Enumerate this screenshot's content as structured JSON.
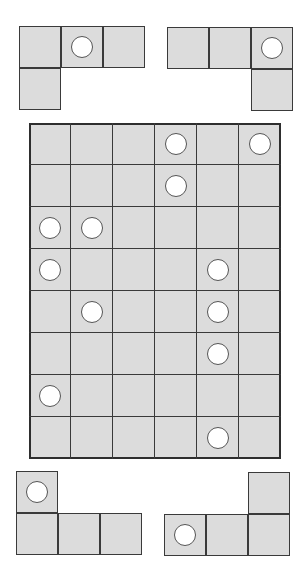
{
  "colors": {
    "cell_fill": "#dcdcdc",
    "border": "#333333",
    "circle_fill": "#ffffff"
  },
  "board": {
    "rows": 8,
    "cols": 6,
    "circles": [
      [
        0,
        3
      ],
      [
        0,
        5
      ],
      [
        1,
        3
      ],
      [
        2,
        0
      ],
      [
        2,
        1
      ],
      [
        3,
        0
      ],
      [
        3,
        4
      ],
      [
        4,
        1
      ],
      [
        4,
        4
      ],
      [
        5,
        4
      ],
      [
        6,
        0
      ],
      [
        7,
        4
      ]
    ]
  },
  "pieces": [
    {
      "name": "piece-top-left",
      "left": 19,
      "top": 26,
      "cells": [
        [
          0,
          0
        ],
        [
          0,
          1
        ],
        [
          0,
          2
        ],
        [
          1,
          0
        ]
      ],
      "circles": [
        [
          0,
          1
        ]
      ]
    },
    {
      "name": "piece-top-right",
      "left": 167,
      "top": 27,
      "cells": [
        [
          0,
          0
        ],
        [
          0,
          1
        ],
        [
          0,
          2
        ],
        [
          1,
          2
        ]
      ],
      "circles": [
        [
          0,
          2
        ]
      ]
    },
    {
      "name": "piece-bottom-left",
      "left": 16,
      "top": 471,
      "cells": [
        [
          0,
          0
        ],
        [
          1,
          0
        ],
        [
          1,
          1
        ],
        [
          1,
          2
        ]
      ],
      "circles": [
        [
          0,
          0
        ]
      ]
    },
    {
      "name": "piece-bottom-right",
      "left": 164,
      "top": 472,
      "cells": [
        [
          0,
          2
        ],
        [
          1,
          0
        ],
        [
          1,
          1
        ],
        [
          1,
          2
        ]
      ],
      "circles": [
        [
          1,
          0
        ]
      ]
    }
  ]
}
